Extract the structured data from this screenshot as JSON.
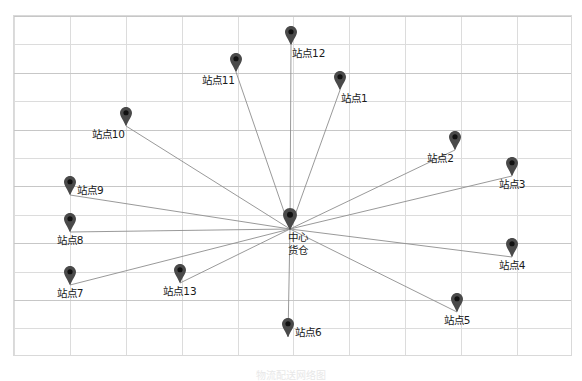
{
  "figure": {
    "title": "",
    "bottom_caption": "物流配送网络图",
    "background_color": "#ffffff",
    "grid_color": "#dcdcdc",
    "line_color": "#8d8d8d",
    "marker_color": "#4a4a4a",
    "plot": {
      "left": 13,
      "top": 15,
      "width": 559,
      "height": 341
    }
  },
  "chart_data": {
    "type": "scatter",
    "title": "",
    "xlabel": "",
    "ylabel": "",
    "grid": true,
    "legend": "none",
    "xlim": [
      0,
      582
    ],
    "ylim": [
      0,
      381
    ],
    "hub": {
      "id": "hub",
      "label": "中心货仓",
      "label_lines": [
        "中心",
        "货仓"
      ],
      "x": 290,
      "y": 229,
      "label_position": "below-left"
    },
    "nodes": [
      {
        "id": "s1",
        "label": "站点1",
        "x": 340,
        "y": 90,
        "label_position": "below-right"
      },
      {
        "id": "s2",
        "label": "站点2",
        "x": 455,
        "y": 150,
        "label_position": "below-left"
      },
      {
        "id": "s3",
        "label": "站点3",
        "x": 512,
        "y": 176,
        "label_position": "below"
      },
      {
        "id": "s4",
        "label": "站点4",
        "x": 512,
        "y": 257,
        "label_position": "below"
      },
      {
        "id": "s5",
        "label": "站点5",
        "x": 457,
        "y": 312,
        "label_position": "below"
      },
      {
        "id": "s6",
        "label": "站点6",
        "x": 288,
        "y": 337,
        "label_position": "right"
      },
      {
        "id": "s7",
        "label": "站点7",
        "x": 70,
        "y": 285,
        "label_position": "below"
      },
      {
        "id": "s8",
        "label": "站点8",
        "x": 70,
        "y": 232,
        "label_position": "below"
      },
      {
        "id": "s9",
        "label": "站点9",
        "x": 70,
        "y": 195,
        "label_position": "right"
      },
      {
        "id": "s10",
        "label": "站点10",
        "x": 126,
        "y": 126,
        "label_position": "below-left"
      },
      {
        "id": "s11",
        "label": "站点11",
        "x": 236,
        "y": 72,
        "label_position": "below-left"
      },
      {
        "id": "s12",
        "label": "站点12",
        "x": 291,
        "y": 45,
        "label_position": "below-right"
      },
      {
        "id": "s13",
        "label": "站点13",
        "x": 180,
        "y": 283,
        "label_position": "below"
      }
    ],
    "edges": [
      {
        "from": "hub",
        "to": "s1"
      },
      {
        "from": "hub",
        "to": "s2"
      },
      {
        "from": "hub",
        "to": "s3"
      },
      {
        "from": "hub",
        "to": "s4"
      },
      {
        "from": "hub",
        "to": "s5"
      },
      {
        "from": "hub",
        "to": "s6"
      },
      {
        "from": "hub",
        "to": "s7"
      },
      {
        "from": "hub",
        "to": "s8"
      },
      {
        "from": "hub",
        "to": "s9"
      },
      {
        "from": "hub",
        "to": "s10"
      },
      {
        "from": "hub",
        "to": "s11"
      },
      {
        "from": "hub",
        "to": "s12"
      },
      {
        "from": "hub",
        "to": "s13"
      }
    ]
  }
}
